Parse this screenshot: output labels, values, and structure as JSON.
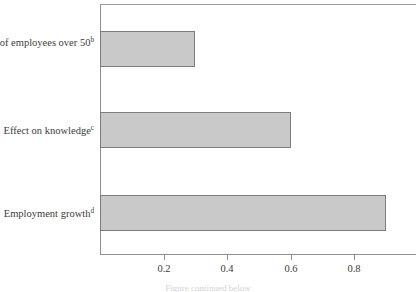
{
  "chart_data": {
    "type": "bar",
    "orientation": "horizontal",
    "title": "",
    "subtitle": "",
    "xlabel": "",
    "ylabel": "",
    "categories": [
      "Percent of employees over 50",
      "Effect on knowledge",
      "Employment growth"
    ],
    "category_footnotes": [
      "b",
      "c",
      "d"
    ],
    "values": [
      0.3,
      0.6,
      0.9
    ],
    "xlim": [
      0,
      1.0
    ],
    "xticks": [
      0.2,
      0.4,
      0.6,
      0.8
    ],
    "xtick_labels": [
      "0.2",
      "0.4",
      "0.6",
      "0.8"
    ],
    "grid": false,
    "legend": null,
    "bar_fill_color": "#c9c9c9",
    "bar_edge_color": "#7d7d7d",
    "axis_color": "#8f8f8f",
    "text_color": "#3c3c3c",
    "background_color": "#ffffff",
    "caption_fragment": "Figure continued below"
  },
  "axis": {
    "tick_labels": [
      "0.2",
      "0.4",
      "0.6",
      "0.8"
    ]
  },
  "rows": [
    {
      "label": "Percent of employees over 50",
      "footnote": "b",
      "value": 0.3
    },
    {
      "label": "Effect on knowledge",
      "footnote": "c",
      "value": 0.6
    },
    {
      "label": "Employment growth",
      "footnote": "d",
      "value": 0.9
    }
  ]
}
